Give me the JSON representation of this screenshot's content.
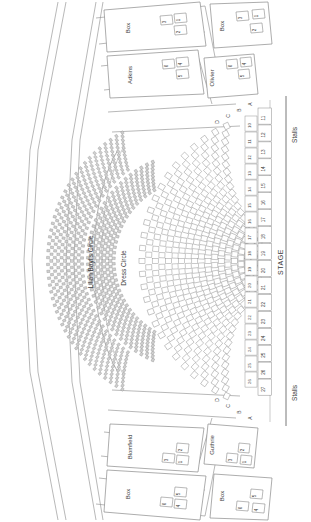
{
  "plan": {
    "venue_label": "STAGE",
    "orientation_note": "rotated-90",
    "width": 311,
    "height": 522
  },
  "levels": [
    {
      "name": "stalls-upper",
      "label": "Stalls"
    },
    {
      "name": "stalls-lower",
      "label": "Stalls"
    },
    {
      "name": "dress-circle",
      "label": "Dress Circle"
    },
    {
      "name": "lilian-baylis-circle",
      "label": "Lilian Baylis Circle"
    }
  ],
  "boxes": [
    {
      "name": "box-top-left",
      "label": "Box",
      "seats": [
        "1",
        "2",
        "3"
      ]
    },
    {
      "name": "box-adkins",
      "label": "Adkins",
      "seats": [
        "4",
        "5",
        "6"
      ]
    },
    {
      "name": "box-top-right",
      "label": "Box",
      "seats": [
        "1",
        "2",
        "3"
      ]
    },
    {
      "name": "box-olivier",
      "label": "Olivier",
      "seats": [
        "4",
        "5",
        "6"
      ]
    },
    {
      "name": "box-bottom-left",
      "label": "Box",
      "seats": [
        "4",
        "5",
        "6"
      ]
    },
    {
      "name": "box-blomfield",
      "label": "Blomfield",
      "seats": [
        "1",
        "2",
        "3"
      ]
    },
    {
      "name": "box-bottom-mid",
      "label": "Box",
      "seats": [
        "4",
        "5",
        "6"
      ]
    },
    {
      "name": "box-guthrie",
      "label": "Guthrie",
      "seats": [
        "1",
        "2",
        "3"
      ]
    }
  ],
  "stalls": {
    "row_letters": [
      "A",
      "B",
      "C",
      "D",
      "E",
      "F",
      "G",
      "H",
      "J",
      "K",
      "L",
      "M",
      "N",
      "P",
      "Q",
      "R",
      "S",
      "T"
    ],
    "seat_numbers_right": [
      "11",
      "12",
      "13",
      "14",
      "15",
      "16",
      "17",
      "18",
      "19",
      "20",
      "21",
      "22",
      "23",
      "24",
      "25",
      "26",
      "27"
    ],
    "seat_numbers_inner": [
      "10",
      "11",
      "12",
      "13",
      "14",
      "15",
      "16",
      "17",
      "18",
      "19",
      "20",
      "21",
      "22",
      "23",
      "24",
      "25",
      "26"
    ],
    "front_row_letters": [
      "A",
      "B",
      "C",
      "D"
    ]
  },
  "colors": {
    "line": "#7a7a7a",
    "line_light": "#b8b8b8",
    "seat_stroke": "#8a8a8a",
    "seat_fill": "#ffffff",
    "seat_fill_dense": "#cfcfcf",
    "text": "#3a3a3a",
    "background": "#ffffff"
  },
  "chart_data": {
    "type": "table",
    "categories": [
      "Stalls",
      "Dress Circle",
      "Lilian Baylis Circle",
      "Boxes"
    ],
    "values": [
      0,
      0,
      0,
      8
    ]
  }
}
